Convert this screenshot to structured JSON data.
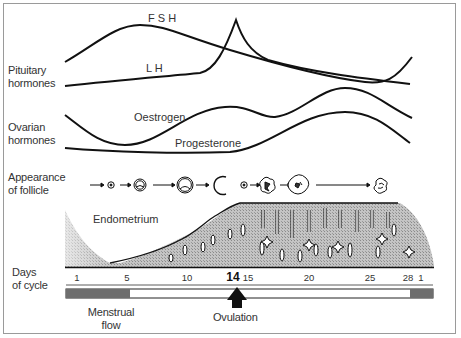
{
  "row_labels": {
    "pituitary": [
      "Pituitary",
      "hormones"
    ],
    "ovarian": [
      "Ovarian",
      "hormones"
    ],
    "follicle": [
      "Appearance",
      "of follicle"
    ],
    "days": [
      "Days",
      "of cycle"
    ]
  },
  "curve_labels": {
    "fsh": "F S H",
    "lh": "L H",
    "oestrogen": "Oestrogen",
    "progesterone": "Progesterone",
    "endometrium": "Endometrium"
  },
  "day_ticks": [
    {
      "label": "1",
      "x": 77
    },
    {
      "label": "5",
      "x": 127
    },
    {
      "label": "10",
      "x": 187
    },
    {
      "label": "14",
      "x": 237,
      "bold": true
    },
    {
      "label": "15",
      "x": 248
    },
    {
      "label": "20",
      "x": 309
    },
    {
      "label": "25",
      "x": 370
    },
    {
      "label": "28",
      "x": 409
    },
    {
      "label": "1",
      "x": 421
    }
  ],
  "bottom_labels": {
    "menstrual": [
      "Menstrual",
      "flow"
    ],
    "ovulation": "Ovulation"
  },
  "follicle_stages": [
    "primordial",
    "primary",
    "secondary",
    "mature",
    "ruptured-ovum",
    "corpus-luteum",
    "mature-corpus-luteum",
    "corpus-albicans"
  ],
  "colors": {
    "line": "#111111",
    "menses": "#6e6e6e",
    "endometrium_fill": "#b8b8b8",
    "text": "#333333"
  }
}
